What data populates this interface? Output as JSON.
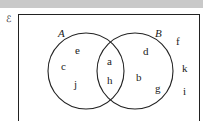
{
  "universal_set": {
    "symbol": "ℰ"
  },
  "sets": [
    {
      "name": "A",
      "elements_only": [
        "e",
        "c",
        "j"
      ]
    },
    {
      "name": "B",
      "elements_only": [
        "d",
        "b",
        "g"
      ]
    }
  ],
  "intersection": [
    "a",
    "h"
  ],
  "outside": [
    "f",
    "k",
    "i"
  ],
  "labels": {
    "universal": "ℰ",
    "set_a": "A",
    "set_b": "B",
    "e": "e",
    "c": "c",
    "j": "j",
    "a": "a",
    "h": "h",
    "d": "d",
    "b": "b",
    "g": "g",
    "f": "f",
    "k": "k",
    "i": "i"
  },
  "colors": {
    "line": "#222222",
    "topbar": "#c9c9c9",
    "background": "#ffffff"
  }
}
